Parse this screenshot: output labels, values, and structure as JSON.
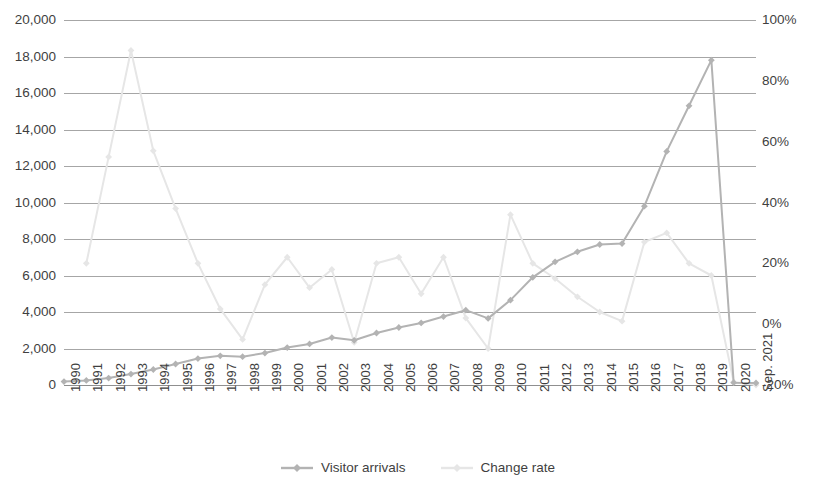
{
  "chart_data": {
    "type": "line",
    "title": "",
    "xlabel": "",
    "ylabel": "",
    "grid": true,
    "legend_position": "bottom",
    "categories": [
      "1990",
      "1991",
      "1992",
      "1993",
      "1994",
      "1995",
      "1996",
      "1997",
      "1998",
      "1999",
      "2000",
      "2001",
      "2002",
      "2003",
      "2004",
      "2005",
      "2006",
      "2007",
      "2008",
      "2009",
      "2010",
      "2011",
      "2012",
      "2013",
      "2014",
      "2015",
      "2016",
      "2017",
      "2018",
      "2019",
      "2020",
      "Sep. 2021"
    ],
    "axes": {
      "left": {
        "label": "",
        "min": 0,
        "max": 20000,
        "step": 2000,
        "ticks": [
          "0",
          "2,000",
          "4,000",
          "6,000",
          "8,000",
          "10,000",
          "12,000",
          "14,000",
          "16,000",
          "18,000",
          "20,000"
        ]
      },
      "right": {
        "label": "",
        "min": -20,
        "max": 100,
        "step": 20,
        "ticks": [
          "-20%",
          "0%",
          "20%",
          "40%",
          "60%",
          "80%",
          "100%"
        ]
      }
    },
    "series": [
      {
        "name": "Visitor arrivals",
        "axis": "left",
        "color": "#b3b3b3",
        "marker": "diamond",
        "values": [
          190,
          250,
          380,
          600,
          850,
          1150,
          1450,
          1600,
          1550,
          1750,
          2050,
          2250,
          2600,
          2450,
          2850,
          3150,
          3400,
          3750,
          4100,
          3650,
          4650,
          5900,
          6750,
          7300,
          7700,
          7750,
          9800,
          12800,
          15300,
          17800,
          130,
          110
        ]
      },
      {
        "name": "Change rate",
        "axis": "right",
        "color": "#e6e6e6",
        "marker": "diamond",
        "values": [
          null,
          20,
          55,
          90,
          57,
          38,
          20,
          5,
          -5,
          13,
          22,
          12,
          18,
          -6,
          20,
          22,
          10,
          22,
          2,
          -8,
          36,
          20,
          15,
          9,
          4,
          1,
          27,
          30,
          20,
          16,
          -19,
          -20
        ]
      }
    ]
  },
  "legend": {
    "items": [
      {
        "label": "Visitor arrivals",
        "color": "#b3b3b3"
      },
      {
        "label": "Change rate",
        "color": "#e6e6e6"
      }
    ]
  }
}
